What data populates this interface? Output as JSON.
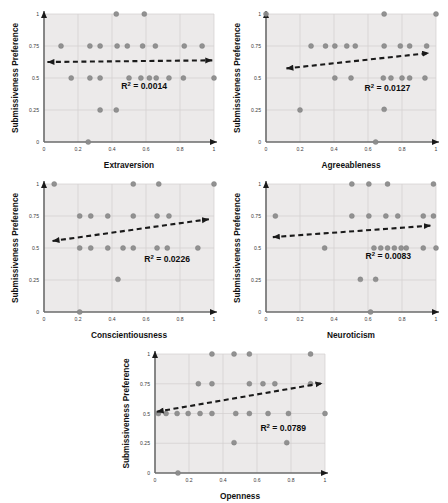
{
  "figure": {
    "background": "#ffffff",
    "plot_background": "#eceaea",
    "grid_color": "#d2cfcf",
    "axis_color": "#6b6b6b",
    "point_color": "#8c8c8c",
    "point_stroke": "#7a7a7a",
    "trend_color": "#1a1a1a",
    "shared_ylabel": "Submissiveness Preference",
    "shared_ytick_labels": [
      "0",
      "0.25",
      "0.5",
      "0.75",
      "1"
    ],
    "shared_xtick_labels": [
      "0",
      "0.2",
      "0.4",
      "0.6",
      "0.8",
      "1"
    ],
    "shared_ylim": [
      0,
      1
    ],
    "shared_xlim": [
      0,
      1
    ]
  },
  "chart_data": [
    {
      "id": "extraversion",
      "type": "scatter",
      "title": "",
      "xlabel": "Extraversion",
      "ylabel": "Submissiveness Preference",
      "xlim": [
        0,
        1
      ],
      "ylim": [
        0,
        1
      ],
      "xticks": [
        0,
        0.2,
        0.4,
        0.6,
        0.8,
        1
      ],
      "yticks": [
        0,
        0.25,
        0.5,
        0.75,
        1
      ],
      "xtick_labels": [
        "0",
        "0.2",
        "0.4",
        "0.6",
        "0.8",
        "1"
      ],
      "ytick_labels": [
        "0",
        "0.25",
        "0.5",
        "0.75",
        "1"
      ],
      "grid": true,
      "annotation": "R² = 0.0014",
      "annotation_value": 0.0014,
      "trendline": {
        "x0": 0.02,
        "y0": 0.625,
        "x1": 0.99,
        "y1": 0.638,
        "style": "dashed",
        "arrows": "both"
      },
      "points": [
        {
          "x": 0.1,
          "y": 0.75
        },
        {
          "x": 0.16,
          "y": 0.5
        },
        {
          "x": 0.26,
          "y": 0.0
        },
        {
          "x": 0.27,
          "y": 0.75
        },
        {
          "x": 0.27,
          "y": 0.5
        },
        {
          "x": 0.33,
          "y": 0.75
        },
        {
          "x": 0.33,
          "y": 0.5
        },
        {
          "x": 0.33,
          "y": 0.25
        },
        {
          "x": 0.425,
          "y": 1.0
        },
        {
          "x": 0.43,
          "y": 0.75
        },
        {
          "x": 0.425,
          "y": 0.25
        },
        {
          "x": 0.49,
          "y": 0.75
        },
        {
          "x": 0.5,
          "y": 0.5
        },
        {
          "x": 0.59,
          "y": 1.0
        },
        {
          "x": 0.58,
          "y": 0.75
        },
        {
          "x": 0.57,
          "y": 0.5
        },
        {
          "x": 0.62,
          "y": 0.5
        },
        {
          "x": 0.655,
          "y": 0.75
        },
        {
          "x": 0.66,
          "y": 0.5
        },
        {
          "x": 0.735,
          "y": 0.5
        },
        {
          "x": 0.825,
          "y": 0.75
        },
        {
          "x": 0.82,
          "y": 0.5
        },
        {
          "x": 0.93,
          "y": 0.75
        },
        {
          "x": 1.0,
          "y": 0.5
        }
      ]
    },
    {
      "id": "agreeableness",
      "type": "scatter",
      "title": "",
      "xlabel": "Agreeableness",
      "ylabel": "Submissiveness Preference",
      "xlim": [
        0,
        1
      ],
      "ylim": [
        0,
        1
      ],
      "xticks": [
        0,
        0.2,
        0.4,
        0.6,
        0.8,
        1
      ],
      "yticks": [
        0,
        0.25,
        0.5,
        0.75,
        1
      ],
      "xtick_labels": [
        "0",
        "0.2",
        "0.4",
        "0.6",
        "0.8",
        "1"
      ],
      "ytick_labels": [
        "0",
        "0.25",
        "0.5",
        "0.75",
        "1"
      ],
      "grid": true,
      "annotation": "R² = 0.0127",
      "annotation_value": 0.0127,
      "trendline": {
        "x0": 0.12,
        "y0": 0.575,
        "x1": 0.96,
        "y1": 0.695,
        "style": "dashed",
        "arrows": "both"
      },
      "points": [
        {
          "x": 0.0,
          "y": 1.0
        },
        {
          "x": 0.2,
          "y": 0.25
        },
        {
          "x": 0.265,
          "y": 0.75
        },
        {
          "x": 0.35,
          "y": 0.75
        },
        {
          "x": 0.405,
          "y": 0.75
        },
        {
          "x": 0.405,
          "y": 0.5
        },
        {
          "x": 0.475,
          "y": 0.75
        },
        {
          "x": 0.5,
          "y": 0.5
        },
        {
          "x": 0.525,
          "y": 0.75
        },
        {
          "x": 0.645,
          "y": 0.0
        },
        {
          "x": 0.695,
          "y": 1.0
        },
        {
          "x": 0.695,
          "y": 0.75
        },
        {
          "x": 0.69,
          "y": 0.5
        },
        {
          "x": 0.695,
          "y": 0.255
        },
        {
          "x": 0.735,
          "y": 0.5
        },
        {
          "x": 0.79,
          "y": 0.75
        },
        {
          "x": 0.8,
          "y": 0.5
        },
        {
          "x": 0.845,
          "y": 0.75
        },
        {
          "x": 0.845,
          "y": 0.5
        },
        {
          "x": 0.945,
          "y": 0.75
        },
        {
          "x": 0.935,
          "y": 0.5
        },
        {
          "x": 1.0,
          "y": 1.0
        }
      ]
    },
    {
      "id": "conscientiousness",
      "type": "scatter",
      "title": "",
      "xlabel": "Conscientiousness",
      "ylabel": "Submissiveness Preference",
      "xlim": [
        0,
        1
      ],
      "ylim": [
        0,
        1
      ],
      "xticks": [
        0,
        0.2,
        0.4,
        0.6,
        0.8,
        1
      ],
      "yticks": [
        0,
        0.25,
        0.5,
        0.75,
        1
      ],
      "xtick_labels": [
        "0",
        "0.2",
        "0.4",
        "0.6",
        "0.8",
        "1"
      ],
      "ytick_labels": [
        "0",
        "0.25",
        "0.5",
        "0.75",
        "1"
      ],
      "grid": true,
      "annotation": "R² = 0.0226",
      "annotation_value": 0.0226,
      "trendline": {
        "x0": 0.05,
        "y0": 0.555,
        "x1": 0.97,
        "y1": 0.725,
        "style": "dashed",
        "arrows": "both"
      },
      "points": [
        {
          "x": 0.06,
          "y": 1.0
        },
        {
          "x": 0.21,
          "y": 0.75
        },
        {
          "x": 0.21,
          "y": 0.5
        },
        {
          "x": 0.21,
          "y": 0.0
        },
        {
          "x": 0.275,
          "y": 0.75
        },
        {
          "x": 0.275,
          "y": 0.5
        },
        {
          "x": 0.375,
          "y": 0.75
        },
        {
          "x": 0.375,
          "y": 0.5
        },
        {
          "x": 0.435,
          "y": 0.255
        },
        {
          "x": 0.465,
          "y": 0.5
        },
        {
          "x": 0.525,
          "y": 1.0
        },
        {
          "x": 0.525,
          "y": 0.75
        },
        {
          "x": 0.525,
          "y": 0.5
        },
        {
          "x": 0.675,
          "y": 1.0
        },
        {
          "x": 0.665,
          "y": 0.75
        },
        {
          "x": 0.665,
          "y": 0.5
        },
        {
          "x": 0.735,
          "y": 0.75
        },
        {
          "x": 0.725,
          "y": 0.5
        },
        {
          "x": 0.905,
          "y": 0.5
        },
        {
          "x": 1.0,
          "y": 1.0
        }
      ]
    },
    {
      "id": "neuroticism",
      "type": "scatter",
      "title": "",
      "xlabel": "Neuroticism",
      "ylabel": "Submissiveness Preference",
      "xlim": [
        0,
        1
      ],
      "ylim": [
        0,
        1
      ],
      "xticks": [
        0,
        0.2,
        0.4,
        0.6,
        0.8,
        1
      ],
      "yticks": [
        0,
        0.25,
        0.5,
        0.75,
        1
      ],
      "xtick_labels": [
        "0",
        "0.2",
        "0.4",
        "0.6",
        "0.8",
        "1"
      ],
      "ytick_labels": [
        "0",
        "0.25",
        "0.5",
        "0.75",
        "1"
      ],
      "grid": true,
      "annotation": "R² = 0.0083",
      "annotation_value": 0.0083,
      "trendline": {
        "x0": 0.04,
        "y0": 0.585,
        "x1": 0.97,
        "y1": 0.675,
        "style": "dashed",
        "arrows": "both"
      },
      "points": [
        {
          "x": 0.055,
          "y": 0.75
        },
        {
          "x": 0.345,
          "y": 0.5
        },
        {
          "x": 0.505,
          "y": 1.0
        },
        {
          "x": 0.505,
          "y": 0.75
        },
        {
          "x": 0.555,
          "y": 0.255
        },
        {
          "x": 0.605,
          "y": 1.0
        },
        {
          "x": 0.605,
          "y": 0.75
        },
        {
          "x": 0.615,
          "y": 0.0
        },
        {
          "x": 0.635,
          "y": 0.5
        },
        {
          "x": 0.645,
          "y": 0.255
        },
        {
          "x": 0.675,
          "y": 0.5
        },
        {
          "x": 0.705,
          "y": 0.75
        },
        {
          "x": 0.715,
          "y": 1.0
        },
        {
          "x": 0.715,
          "y": 0.5
        },
        {
          "x": 0.755,
          "y": 0.5
        },
        {
          "x": 0.775,
          "y": 0.75
        },
        {
          "x": 0.795,
          "y": 0.5
        },
        {
          "x": 0.825,
          "y": 0.5
        },
        {
          "x": 0.925,
          "y": 0.75
        },
        {
          "x": 0.925,
          "y": 0.5
        },
        {
          "x": 0.985,
          "y": 1.0
        },
        {
          "x": 0.985,
          "y": 0.75
        },
        {
          "x": 1.0,
          "y": 0.5
        }
      ]
    },
    {
      "id": "openness",
      "type": "scatter",
      "title": "",
      "xlabel": "Openness",
      "ylabel": "Submissiveness Preference",
      "xlim": [
        0,
        1
      ],
      "ylim": [
        0,
        1
      ],
      "xticks": [
        0,
        0.2,
        0.4,
        0.6,
        0.8,
        1
      ],
      "yticks": [
        0,
        0.25,
        0.5,
        0.75,
        1
      ],
      "xtick_labels": [
        "0",
        "0.2",
        "0.4",
        "0.6",
        "0.8",
        "1"
      ],
      "ytick_labels": [
        "0",
        "0.25",
        "0.5",
        "0.75",
        "1"
      ],
      "grid": true,
      "annotation": "R² = 0.0789",
      "annotation_value": 0.0789,
      "trendline": {
        "x0": 0.01,
        "y0": 0.515,
        "x1": 0.985,
        "y1": 0.755,
        "style": "dashed",
        "arrows": "both"
      },
      "points": [
        {
          "x": 0.02,
          "y": 0.5
        },
        {
          "x": 0.065,
          "y": 0.5
        },
        {
          "x": 0.13,
          "y": 0.5
        },
        {
          "x": 0.135,
          "y": 0.0
        },
        {
          "x": 0.195,
          "y": 0.5
        },
        {
          "x": 0.255,
          "y": 0.75
        },
        {
          "x": 0.265,
          "y": 0.5
        },
        {
          "x": 0.335,
          "y": 1.0
        },
        {
          "x": 0.335,
          "y": 0.75
        },
        {
          "x": 0.335,
          "y": 0.5
        },
        {
          "x": 0.465,
          "y": 1.0
        },
        {
          "x": 0.465,
          "y": 0.255
        },
        {
          "x": 0.475,
          "y": 0.5
        },
        {
          "x": 0.555,
          "y": 1.0
        },
        {
          "x": 0.555,
          "y": 0.75
        },
        {
          "x": 0.555,
          "y": 0.5
        },
        {
          "x": 0.635,
          "y": 0.75
        },
        {
          "x": 0.665,
          "y": 0.5
        },
        {
          "x": 0.705,
          "y": 0.75
        },
        {
          "x": 0.775,
          "y": 0.255
        },
        {
          "x": 0.785,
          "y": 0.5
        },
        {
          "x": 0.915,
          "y": 1.0
        },
        {
          "x": 0.915,
          "y": 0.75
        },
        {
          "x": 1.0,
          "y": 0.5
        }
      ]
    }
  ]
}
